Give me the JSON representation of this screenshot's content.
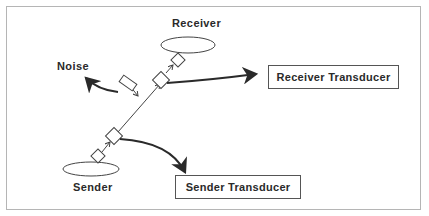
{
  "diagram": {
    "labels": {
      "receiver": "Receiver",
      "sender": "Sender",
      "noise": "Noise"
    },
    "boxes": {
      "receiver_transducer": "Receiver Transducer",
      "sender_transducer": "Sender Transducer"
    },
    "colors": {
      "frame": "#b5b5b5",
      "stroke": "#2a2a2a",
      "text": "#2a2a2a"
    }
  }
}
